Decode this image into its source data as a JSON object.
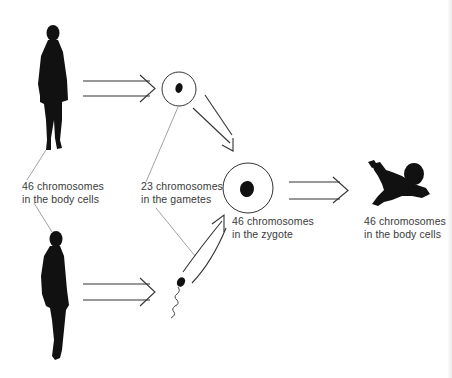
{
  "diagram": {
    "type": "flow",
    "title": "",
    "nodes": [
      {
        "id": "mother",
        "icon": "woman-silhouette-icon"
      },
      {
        "id": "father",
        "icon": "man-silhouette-icon"
      },
      {
        "id": "egg",
        "icon": "egg-cell-icon"
      },
      {
        "id": "sperm",
        "icon": "sperm-cell-icon"
      },
      {
        "id": "zygote",
        "icon": "zygote-cell-icon"
      },
      {
        "id": "baby",
        "icon": "baby-silhouette-icon"
      }
    ],
    "edges": [
      {
        "from": "mother",
        "to": "egg",
        "style": "double-arrow"
      },
      {
        "from": "father",
        "to": "sperm",
        "style": "double-arrow"
      },
      {
        "from": "egg",
        "to": "zygote",
        "style": "double-arrow"
      },
      {
        "from": "sperm",
        "to": "zygote",
        "style": "double-arrow"
      },
      {
        "from": "zygote",
        "to": "baby",
        "style": "double-arrow"
      }
    ],
    "labels": {
      "parents_body_cells": {
        "line1": "46 chromosomes",
        "line2": "in the body cells"
      },
      "gametes": {
        "line1": "23 chromosomes",
        "line2": "in the gametes"
      },
      "zygote": {
        "line1": "46 chromosomes",
        "line2": "in the zygote"
      },
      "baby_body_cells": {
        "line1": "46 chromosomes",
        "line2": "in the body cells"
      }
    },
    "colors": {
      "ink": "#111111",
      "line": "#444444",
      "leader": "#8a8a8a",
      "text": "#3a3a3a",
      "background": "#ffffff"
    }
  }
}
